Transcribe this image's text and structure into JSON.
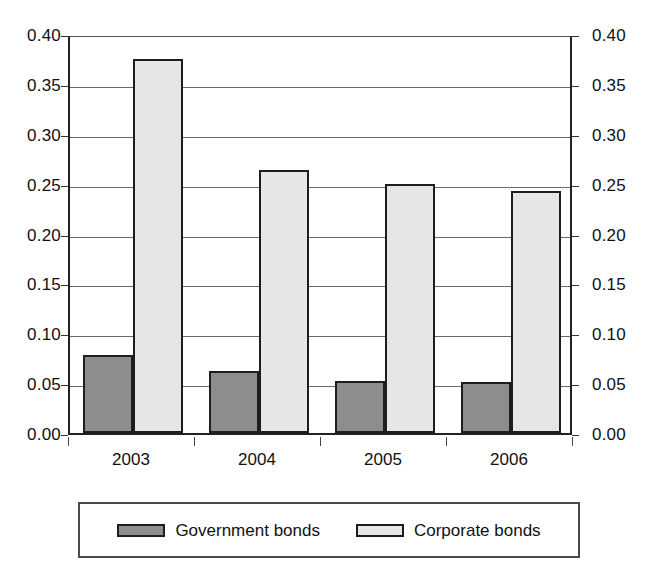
{
  "chart_data": {
    "type": "bar",
    "title": "",
    "subtitle": "",
    "xlabel": "",
    "ylabel": "",
    "categories": [
      "2003",
      "2004",
      "2005",
      "2006"
    ],
    "series": [
      {
        "name": "Government bonds",
        "color": "#8d8d8d",
        "values": [
          0.078,
          0.062,
          0.052,
          0.051
        ]
      },
      {
        "name": "Corporate bonds",
        "color": "#e6e6e6",
        "values": [
          0.375,
          0.264,
          0.25,
          0.243
        ]
      }
    ],
    "ylim": [
      0.0,
      0.4
    ],
    "ytick_values": [
      0.0,
      0.05,
      0.1,
      0.15,
      0.2,
      0.25,
      0.3,
      0.35,
      0.4
    ],
    "ytick_labels": [
      "0.00",
      "0.05",
      "0.10",
      "0.15",
      "0.20",
      "0.25",
      "0.30",
      "0.35",
      "0.40"
    ],
    "dual_y_axis": true,
    "right_ytick_labels": [
      "0.00",
      "0.05",
      "0.10",
      "0.15",
      "0.20",
      "0.25",
      "0.30",
      "0.35",
      "0.40"
    ],
    "grid": true,
    "grid_axis": "y",
    "legend_position": "bottom",
    "legend_entries": [
      "Government bonds",
      "Corporate bonds"
    ],
    "bar_border_color": "#1d1d1d",
    "background_color": "#ffffff"
  }
}
